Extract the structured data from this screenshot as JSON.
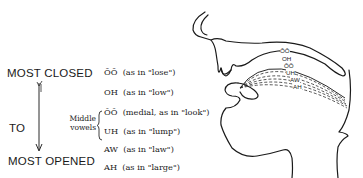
{
  "scale": {
    "top_label": "MOST CLOSED",
    "middle_label": "TO",
    "bottom_label": "MOST OPENED",
    "arrow_direction": "down"
  },
  "group_label": {
    "line1": "Middle",
    "line2": "vowels"
  },
  "vowels": [
    {
      "sound": "ŌŌ",
      "example": "(as in \"lose\")"
    },
    {
      "sound": "OH",
      "example": "(as in \"low\")"
    },
    {
      "sound": "ŎŎ",
      "example": "(medial, as in \"look\")"
    },
    {
      "sound": "UH",
      "example": "(as in \"lump\")"
    },
    {
      "sound": "AW",
      "example": "(as in \"law\")"
    },
    {
      "sound": "AH",
      "example": "(as in \"large\")"
    }
  ],
  "diagram": {
    "curve_labels": [
      "ŌŌ",
      "OH",
      "ŎŎ",
      "UH",
      "AW",
      "AH"
    ],
    "stroke_color": "#1a1a1a"
  }
}
